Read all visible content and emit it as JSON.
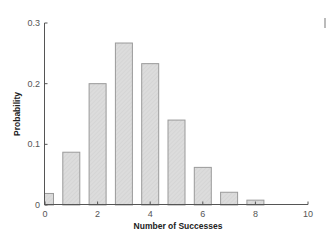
{
  "chart_data": {
    "type": "bar",
    "title": "",
    "xlabel": "Number of Successes",
    "ylabel": "Probability",
    "categories": [
      0,
      1,
      2,
      3,
      4,
      5,
      6,
      7,
      8
    ],
    "values": [
      0.019,
      0.087,
      0.2,
      0.267,
      0.233,
      0.14,
      0.062,
      0.021,
      0.008
    ],
    "xlim": [
      0,
      10
    ],
    "ylim": [
      0,
      0.3
    ],
    "xticks": [
      0,
      2,
      4,
      6,
      8,
      10
    ],
    "xtick_labels": [
      "0",
      "2",
      "4",
      "6",
      "8",
      "10"
    ],
    "yticks": [
      0,
      0.1,
      0.2,
      0.3
    ],
    "ytick_labels": [
      "0",
      "0.1",
      "0.2",
      "0.3"
    ],
    "grid": false,
    "legend": null,
    "colors": {
      "bar_fill": "#dcdcdc",
      "bar_stroke": "#9a9a9a",
      "axis": "#555555"
    }
  }
}
